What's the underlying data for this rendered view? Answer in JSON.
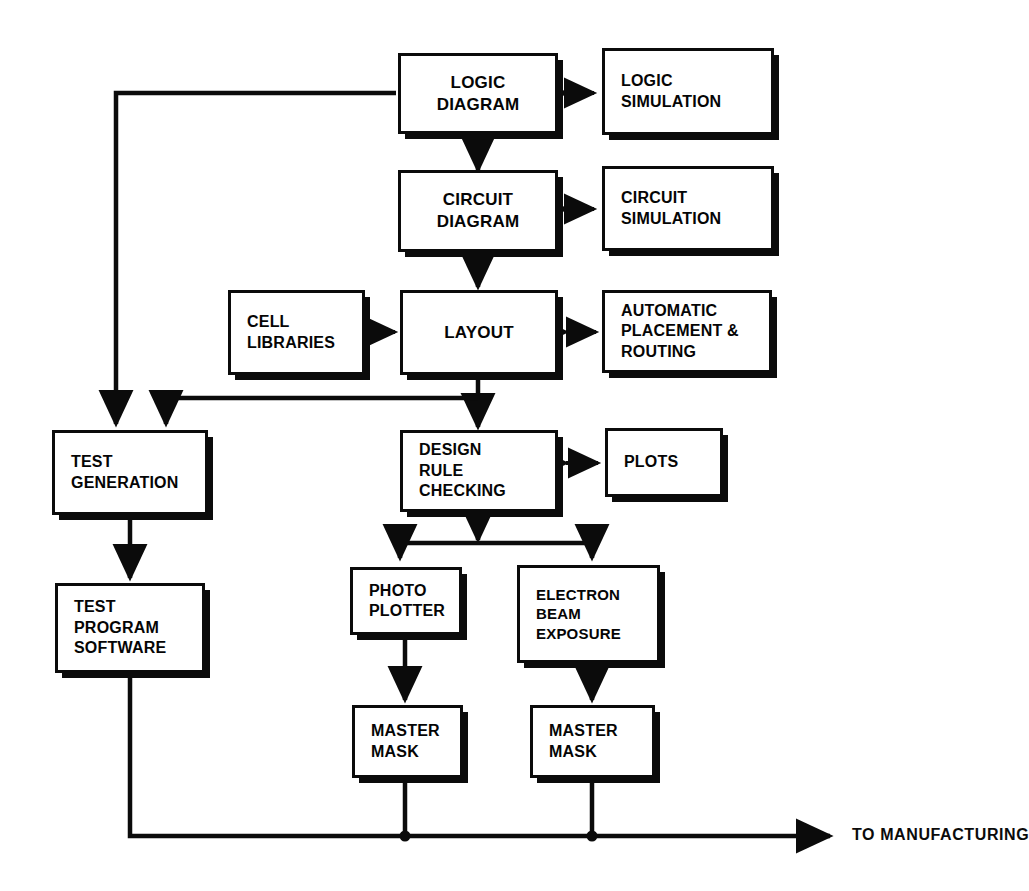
{
  "diagram": {
    "stroke_color": "#0b0b0b",
    "background_color": "#ffffff",
    "nodes": [
      {
        "id": "logic_diagram",
        "label": "LOGIC\nDIAGRAM"
      },
      {
        "id": "logic_simulation",
        "label": "LOGIC\nSIMULATION"
      },
      {
        "id": "circuit_diagram",
        "label": "CIRCUIT\nDIAGRAM"
      },
      {
        "id": "circuit_simulation",
        "label": "CIRCUIT\nSIMULATION"
      },
      {
        "id": "cell_libraries",
        "label": "CELL\nLIBRARIES"
      },
      {
        "id": "layout",
        "label": "LAYOUT"
      },
      {
        "id": "auto_place_route",
        "label": "AUTOMATIC\nPLACEMENT &\nROUTING"
      },
      {
        "id": "test_generation",
        "label": "TEST\nGENERATION"
      },
      {
        "id": "design_rule_check",
        "label": "DESIGN\nRULE\nCHECKING"
      },
      {
        "id": "plots",
        "label": "PLOTS"
      },
      {
        "id": "test_program_sw",
        "label": "TEST\nPROGRAM\nSOFTWARE"
      },
      {
        "id": "photo_plotter",
        "label": "PHOTO\nPLOTTER"
      },
      {
        "id": "electron_beam",
        "label": "ELECTRON\nBEAM\nEXPOSURE"
      },
      {
        "id": "master_mask_left",
        "label": "MASTER\nMASK"
      },
      {
        "id": "master_mask_right",
        "label": "MASTER\nMASK"
      }
    ],
    "bus_label": "TO MANUFACTURING",
    "edges": [
      {
        "from": "logic_diagram",
        "to": "logic_simulation",
        "type": "bidirectional"
      },
      {
        "from": "logic_diagram",
        "to": "circuit_diagram",
        "type": "arrow"
      },
      {
        "from": "circuit_diagram",
        "to": "circuit_simulation",
        "type": "bidirectional"
      },
      {
        "from": "circuit_diagram",
        "to": "layout",
        "type": "arrow"
      },
      {
        "from": "cell_libraries",
        "to": "layout",
        "type": "arrow"
      },
      {
        "from": "layout",
        "to": "auto_place_route",
        "type": "bidirectional"
      },
      {
        "from": "layout",
        "to": "design_rule_check",
        "type": "arrow"
      },
      {
        "from": "logic_diagram",
        "to": "test_generation",
        "type": "arrow"
      },
      {
        "from": "layout",
        "to": "test_generation",
        "type": "arrow"
      },
      {
        "from": "design_rule_check",
        "to": "plots",
        "type": "bidirectional"
      },
      {
        "from": "design_rule_check",
        "to": "photo_plotter",
        "type": "arrow"
      },
      {
        "from": "design_rule_check",
        "to": "electron_beam",
        "type": "arrow"
      },
      {
        "from": "test_generation",
        "to": "test_program_sw",
        "type": "arrow"
      },
      {
        "from": "photo_plotter",
        "to": "master_mask_left",
        "type": "arrow"
      },
      {
        "from": "electron_beam",
        "to": "master_mask_right",
        "type": "arrow"
      },
      {
        "from": "test_program_sw",
        "to": "manufacturing_bus",
        "type": "line"
      },
      {
        "from": "master_mask_left",
        "to": "manufacturing_bus",
        "type": "junction"
      },
      {
        "from": "master_mask_right",
        "to": "manufacturing_bus",
        "type": "junction"
      },
      {
        "from": "manufacturing_bus",
        "to": "manufacturing",
        "type": "arrow"
      }
    ]
  }
}
